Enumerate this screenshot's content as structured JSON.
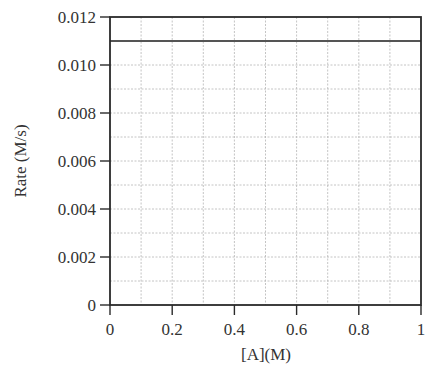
{
  "chart_data": {
    "type": "line",
    "title": "",
    "xlabel": "[A](M)",
    "ylabel": "Rate (M/s)",
    "xlim": [
      0,
      1
    ],
    "ylim": [
      0,
      0.012
    ],
    "x_ticks": [
      "0",
      "0.2",
      "0.4",
      "0.6",
      "0.8",
      "1"
    ],
    "y_ticks": [
      "0",
      "0.002",
      "0.004",
      "0.006",
      "0.008",
      "0.010",
      "0.012"
    ],
    "grid": true,
    "legend": null,
    "series": [
      {
        "name": "Rate",
        "x": [
          0,
          1
        ],
        "y": [
          0.011,
          0.011
        ],
        "color": "#555555"
      }
    ]
  }
}
